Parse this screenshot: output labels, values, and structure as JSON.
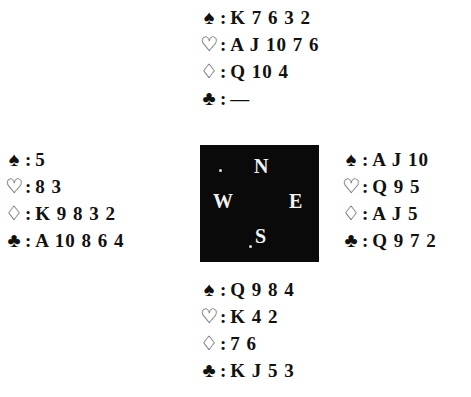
{
  "suit_symbols": {
    "spades": "♠",
    "hearts": "♡",
    "diamonds": "♢",
    "clubs": "♣"
  },
  "separator": ":",
  "hands": {
    "north": {
      "spades": "K 7 6 3 2",
      "hearts": "A J 10 7 6",
      "diamonds": "Q 10 4",
      "clubs": "—"
    },
    "west": {
      "spades": "5",
      "hearts": "8 3",
      "diamonds": "K 9 8 3 2",
      "clubs": "A 10 8 6 4"
    },
    "east": {
      "spades": "A J 10",
      "hearts": "Q 9 5",
      "diamonds": "A J 5",
      "clubs": "Q 9 7 2"
    },
    "south": {
      "spades": "Q 9 8 4",
      "hearts": "K 4 2",
      "diamonds": "7 6",
      "clubs": "K J 5 3"
    }
  },
  "compass": {
    "north": "N",
    "west": "W",
    "east": "E",
    "south": "S"
  },
  "colors": {
    "compass_bg": "#0a0a0a",
    "compass_text": "#f2f2f2",
    "text": "#111111"
  }
}
